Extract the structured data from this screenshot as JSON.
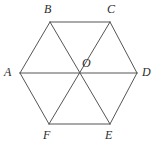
{
  "figure": {
    "type": "geometry-diagram",
    "shape": "regular-hexagon-with-diagonals",
    "background_color": "#ffffff",
    "stroke_color": "#555555",
    "label_color": "#2b2b2b",
    "stroke_width": 1,
    "canvas": {
      "width": 158,
      "height": 148
    },
    "center": {
      "name": "O",
      "x": 79,
      "y": 73
    },
    "vertices": [
      {
        "name": "A",
        "x": 20,
        "y": 73,
        "label_x": 4,
        "label_y": 66
      },
      {
        "name": "B",
        "x": 50,
        "y": 22,
        "label_x": 44,
        "label_y": 3
      },
      {
        "name": "C",
        "x": 110,
        "y": 22,
        "label_x": 107,
        "label_y": 3
      },
      {
        "name": "D",
        "x": 137,
        "y": 73,
        "label_x": 142,
        "label_y": 66
      },
      {
        "name": "E",
        "x": 110,
        "y": 124,
        "label_x": 105,
        "label_y": 129
      },
      {
        "name": "F",
        "x": 49,
        "y": 124,
        "label_x": 43,
        "label_y": 129
      }
    ],
    "center_label": {
      "name": "O",
      "label_x": 82,
      "label_y": 57
    },
    "edges": [
      {
        "from": "A",
        "to": "B"
      },
      {
        "from": "B",
        "to": "C"
      },
      {
        "from": "C",
        "to": "D"
      },
      {
        "from": "D",
        "to": "E"
      },
      {
        "from": "E",
        "to": "F"
      },
      {
        "from": "F",
        "to": "A"
      }
    ],
    "diagonals": [
      {
        "from": "A",
        "to": "D"
      },
      {
        "from": "B",
        "to": "E"
      },
      {
        "from": "C",
        "to": "F"
      }
    ]
  }
}
